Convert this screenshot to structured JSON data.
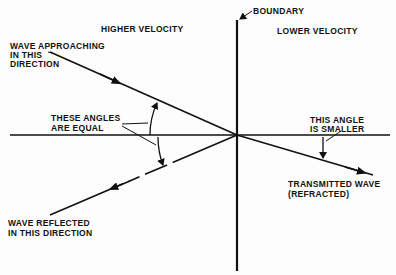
{
  "diagram": {
    "colors": {
      "ink": "#111111",
      "background": "#fdfdfd"
    },
    "regions": {
      "left": "HIGHER VELOCITY",
      "right": "LOWER VELOCITY"
    },
    "labels": {
      "boundary": "BOUNDARY",
      "incident_line1": "WAVE APPROACHING",
      "incident_line2": "IN THIS",
      "incident_line3": "DIRECTION",
      "equal_line1": "THESE ANGLES",
      "equal_line2": "ARE EQUAL",
      "smaller_line1": "THIS ANGLE",
      "smaller_line2": "IS SMALLER",
      "transmitted_line1": "TRANSMITTED WAVE",
      "transmitted_line2": "(REFRACTED)",
      "reflected_line1": "WAVE REFLECTED",
      "reflected_line2": "IN THIS DIRECTION"
    },
    "elements": {
      "boundary_line": "vertical solid line",
      "normal_line": "horizontal solid line",
      "incident_ray": "solid arrow toward boundary",
      "reflected_ray": "dashed arrow away from boundary",
      "refracted_ray": "solid arrow away from boundary",
      "angle_arcs": [
        "incident angle arc",
        "reflected angle arc",
        "refracted angle arc"
      ]
    }
  }
}
